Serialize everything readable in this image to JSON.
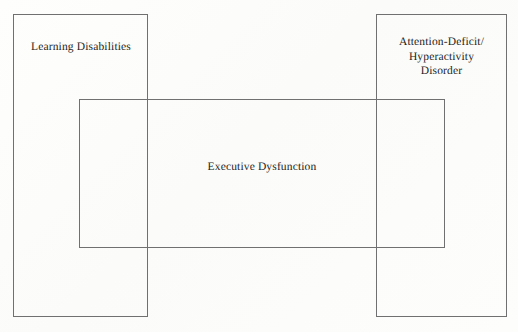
{
  "figure": {
    "type": "venn-rectangle-diagram",
    "background_color": "#fdfdfb",
    "line_color": "#707070",
    "text_color": "#1c1c1c"
  },
  "sets": {
    "left": {
      "label": "Learning Disabilities",
      "shape": "rectangle"
    },
    "right": {
      "label": "Attention-Deficit/\nHyperactivity\nDisorder",
      "shape": "rectangle"
    },
    "middle": {
      "label": "Executive Dysfunction",
      "shape": "rectangle"
    }
  }
}
